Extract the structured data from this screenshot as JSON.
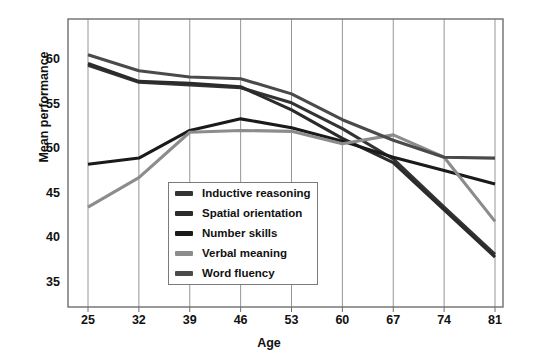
{
  "chart_data": {
    "type": "line",
    "title": "",
    "xlabel": "Age",
    "ylabel": "Mean performance",
    "x": [
      25,
      32,
      39,
      46,
      53,
      60,
      67,
      74,
      81
    ],
    "categories": [
      "25",
      "32",
      "39",
      "46",
      "53",
      "60",
      "67",
      "74",
      "81"
    ],
    "xlim": [
      25,
      81
    ],
    "ylim": [
      35,
      62
    ],
    "yticks": [
      35,
      40,
      45,
      50,
      55,
      60
    ],
    "grid": "vertical",
    "legend_position": "inside-bottom-left",
    "series": [
      {
        "name": "Inductive reasoning",
        "color": "#333333",
        "values": [
          59.4,
          57.5,
          57.2,
          56.9,
          55.2,
          52.3,
          48.9,
          43.5,
          38.2
        ]
      },
      {
        "name": "Spatial orientation",
        "color": "#2b2b2b",
        "values": [
          59.6,
          57.6,
          57.4,
          57.0,
          54.4,
          51.2,
          48.5,
          43.2,
          37.9
        ]
      },
      {
        "name": "Number skills",
        "color": "#1a1a1a",
        "values": [
          48.3,
          49.0,
          52.1,
          53.4,
          52.4,
          50.9,
          49.1,
          47.6,
          46.1
        ]
      },
      {
        "name": "Verbal meaning",
        "color": "#8c8c8c",
        "values": [
          43.5,
          46.8,
          51.9,
          52.1,
          52.0,
          50.6,
          51.6,
          49.1,
          41.9
        ]
      },
      {
        "name": "Word fluency",
        "color": "#4a4a4a",
        "values": [
          60.6,
          58.8,
          58.1,
          57.9,
          56.2,
          53.3,
          51.0,
          49.1,
          49.0
        ]
      }
    ]
  },
  "axes": {
    "ylabel": "Mean performance",
    "xlabel": "Age",
    "yticks": [
      "60",
      "55",
      "50",
      "45",
      "40",
      "35"
    ],
    "xticks": [
      "25",
      "32",
      "39",
      "46",
      "53",
      "60",
      "67",
      "74",
      "81"
    ]
  },
  "legend": {
    "items": [
      {
        "label": "Inductive reasoning",
        "color": "#333333"
      },
      {
        "label": "Spatial orientation",
        "color": "#2b2b2b"
      },
      {
        "label": "Number skills",
        "color": "#1a1a1a"
      },
      {
        "label": "Verbal meaning",
        "color": "#8c8c8c"
      },
      {
        "label": "Word fluency",
        "color": "#4a4a4a"
      }
    ]
  },
  "style": {
    "axis_color": "#6e6e6e",
    "grid_color": "#8a8a8a",
    "background": "#ffffff",
    "text_color": "#111111"
  }
}
